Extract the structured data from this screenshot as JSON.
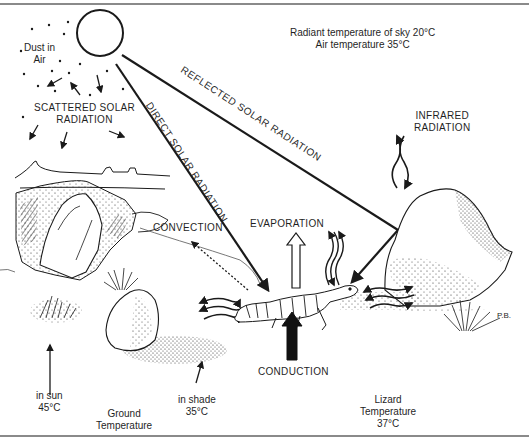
{
  "diagram": {
    "type": "illustration",
    "signature": "P.B."
  },
  "labels": {
    "dust_line1": "Dust in",
    "dust_line2": "Air",
    "scattered_line1": "SCATTERED SOLAR",
    "scattered_line2": "RADIATION",
    "sky_line1": "Radiant temperature of sky 20°C",
    "sky_line2": "Air temperature 35°C",
    "reflected": "REFLECTED SOLAR RADIATION",
    "direct": "DIRECT SOLAR RADIATION",
    "infrared_line1": "INFRARED",
    "infrared_line2": "RADIATION",
    "convection": "CONVECTION",
    "evaporation": "EVAPORATION",
    "conduction": "CONDUCTION",
    "in_sun_line1": "in sun",
    "in_sun_line2": "45°C",
    "in_shade_line1": "in shade",
    "in_shade_line2": "35°C",
    "ground_line1": "Ground",
    "ground_line2": "Temperature",
    "lizard_line1": "Lizard",
    "lizard_line2": "Temperature",
    "lizard_line3": "37°C",
    "signature": "P.B."
  },
  "colors": {
    "ink": "#1a1a1a",
    "border": "#8a8a8a",
    "background": "#ffffff"
  }
}
